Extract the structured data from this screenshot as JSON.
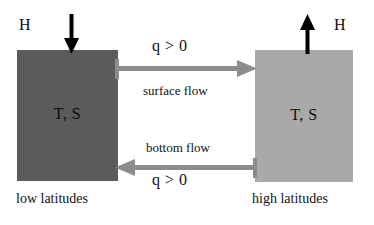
{
  "diagram": {
    "colors": {
      "low_latitude_box": "#5b5b5b",
      "high_latitude_box": "#a9a9a9",
      "flow_arrow": "#8c8c8c",
      "forcing_arrow": "#000000",
      "background": "#ffffff",
      "text": "#111111"
    },
    "boxes": [
      {
        "id": "low-latitude",
        "interior_label": "T, S",
        "caption": "low latitudes",
        "shade": "dark gray"
      },
      {
        "id": "high-latitude",
        "interior_label": "T, S",
        "caption": "high latitudes",
        "shade": "light gray"
      }
    ],
    "forcing": [
      {
        "id": "left-forcing",
        "label": "H",
        "icon": "arrow-down-icon",
        "direction": "down"
      },
      {
        "id": "right-forcing",
        "label": "H",
        "icon": "arrow-up-icon",
        "direction": "up"
      }
    ],
    "flows": [
      {
        "id": "surface-flow",
        "icon": "arrow-right-icon",
        "direction": "right",
        "q_label": "q > 0",
        "name_label": "surface flow"
      },
      {
        "id": "bottom-flow",
        "icon": "arrow-left-icon",
        "direction": "left",
        "q_label": "q > 0",
        "name_label": "bottom flow"
      }
    ]
  }
}
